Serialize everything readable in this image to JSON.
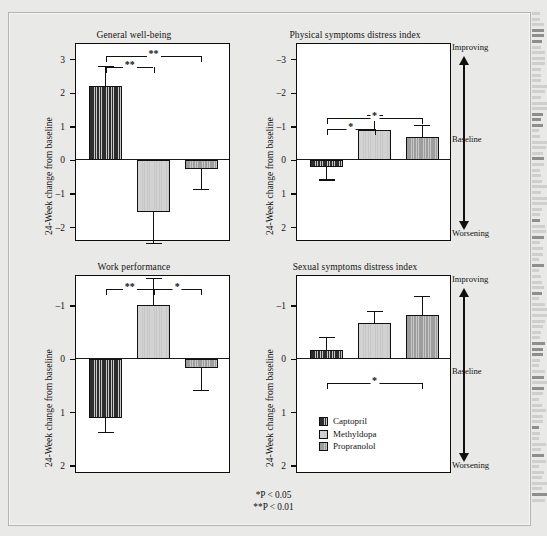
{
  "figure": {
    "ylabel": "24-Week change from baseline",
    "scale_top": "Improving",
    "scale_mid": "Baseline",
    "scale_bottom": "Worsening",
    "pnote_1": "*P < 0.05",
    "pnote_2": "**P < 0.01",
    "legend": {
      "items": [
        {
          "label": "Captopril",
          "color": "#2d2d2d"
        },
        {
          "label": "Methyldopa",
          "color": "#d2d2d2"
        },
        {
          "label": "Propranolol",
          "color": "#9d9d9d"
        }
      ]
    }
  },
  "chart_data": [
    {
      "type": "bar",
      "title": "General well-being",
      "panel": "top-left",
      "xlabel": "",
      "ylabel": "24-Week change from baseline",
      "categories": [
        "Captopril",
        "Methyldopa",
        "Propranolol"
      ],
      "values": [
        2.2,
        -1.55,
        -0.28
      ],
      "errors_upper": [
        0.58,
        0.0,
        0.0
      ],
      "errors_lower": [
        0.0,
        0.95,
        0.6
      ],
      "yticks": [
        3,
        2,
        1,
        0,
        -1,
        -2
      ],
      "ylim": [
        3.45,
        -2.35
      ],
      "y_inverted": true,
      "grid": false,
      "annotations": [
        {
          "from": "Captopril",
          "to": "Methyldopa",
          "stars": "**"
        },
        {
          "from": "Captopril",
          "to": "Propranolol",
          "stars": "**"
        }
      ]
    },
    {
      "type": "bar",
      "title": "Physical symptoms distress index",
      "panel": "top-right",
      "xlabel": "",
      "ylabel": "24-Week change from baseline",
      "categories": [
        "Captopril",
        "Methyldopa",
        "Propranolol"
      ],
      "values": [
        0.22,
        -0.9,
        -0.67
      ],
      "errors_upper": [
        0.38,
        0.0,
        0.0
      ],
      "errors_lower": [
        0.0,
        0.42,
        0.35
      ],
      "yticks": [
        -3,
        -2,
        -1,
        0,
        1,
        2
      ],
      "ylim": [
        -3.45,
        2.35
      ],
      "y_inverted": true,
      "grid": false,
      "annotations": [
        {
          "from": "Captopril",
          "to": "Methyldopa",
          "stars": "*"
        },
        {
          "from": "Captopril",
          "to": "Propranolol",
          "stars": "*"
        }
      ]
    },
    {
      "type": "bar",
      "title": "Work performance",
      "panel": "bottom-left",
      "xlabel": "",
      "ylabel": "24-Week change from baseline",
      "categories": [
        "Captopril",
        "Methyldopa",
        "Propranolol"
      ],
      "values": [
        1.11,
        -1.0,
        0.18
      ],
      "errors_upper": [
        0.28,
        0.0,
        0.42
      ],
      "errors_lower": [
        0.0,
        0.5,
        0.0
      ],
      "yticks": [
        -1,
        0,
        1,
        2
      ],
      "ylim": [
        -1.55,
        2.1
      ],
      "y_inverted": true,
      "grid": false,
      "annotations": [
        {
          "from": "Captopril",
          "to": "Methyldopa",
          "stars": "**"
        },
        {
          "from": "Methyldopa",
          "to": "Propranolol",
          "stars": "*"
        }
      ]
    },
    {
      "type": "bar",
      "title": "Sexual symptoms distress index",
      "panel": "bottom-right",
      "xlabel": "",
      "ylabel": "24-Week change from baseline",
      "categories": [
        "Captopril",
        "Methyldopa",
        "Propranolol"
      ],
      "values": [
        -0.17,
        -0.67,
        -0.82
      ],
      "errors_upper": [
        0.0,
        0.0,
        0.0
      ],
      "errors_lower": [
        0.23,
        0.22,
        0.35
      ],
      "yticks": [
        -1,
        0,
        1,
        2
      ],
      "ylim": [
        -1.55,
        2.1
      ],
      "y_inverted": true,
      "grid": false,
      "annotations": [
        {
          "from": "Captopril",
          "to": "Propranolol",
          "stars": "*"
        }
      ]
    }
  ]
}
